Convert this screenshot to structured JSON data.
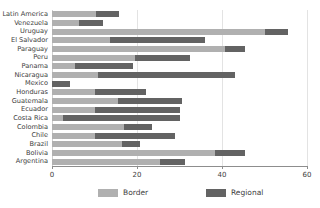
{
  "chart_data": {
    "type": "bar",
    "orientation": "horizontal",
    "stacked": true,
    "title": "",
    "xlabel": "",
    "ylabel": "",
    "xlim": [
      0,
      60
    ],
    "xticks": [
      0,
      20,
      40,
      60
    ],
    "xtick_labels": [
      "0",
      "20",
      "40",
      "60"
    ],
    "grid": true,
    "grid_axis": "x",
    "legend_position": "bottom",
    "categories": [
      "Latin America",
      "Venezuela",
      "Uruguay",
      "El Salvador",
      "Paraguay",
      "Peru",
      "Panama",
      "Nicaragua",
      "Mexico",
      "Honduras",
      "Guatemala",
      "Ecuador",
      "Costa Rica",
      "Colombia",
      "Chile",
      "Brazil",
      "Bolivia",
      "Argentina"
    ],
    "series": [
      {
        "name": "Border",
        "color": "#b0b0b0",
        "values": [
          10.4,
          6.4,
          50.1,
          13.6,
          40.7,
          19.5,
          5.4,
          10.8,
          0.0,
          10.1,
          15.5,
          10.1,
          2.6,
          16.9,
          10.1,
          16.5,
          38.4,
          25.4
        ]
      },
      {
        "name": "Regional",
        "color": "#636363",
        "values": [
          5.4,
          5.6,
          5.4,
          22.4,
          4.7,
          12.9,
          13.6,
          32.2,
          4.2,
          12.0,
          15.1,
          20.0,
          27.5,
          6.6,
          18.8,
          4.2,
          7.1,
          5.9
        ]
      }
    ],
    "totals": [
      15.8,
      12.0,
      55.5,
      36.0,
      45.4,
      32.4,
      19.0,
      43.0,
      4.2,
      22.1,
      30.6,
      30.1,
      30.1,
      23.5,
      28.9,
      20.7,
      45.5,
      31.3
    ]
  },
  "legend": {
    "items": [
      {
        "label": "Border",
        "swatch": "border-swatch"
      },
      {
        "label": "Regional",
        "swatch": "regional-swatch"
      }
    ]
  },
  "colors": {
    "border": "#b0b0b0",
    "regional": "#636363",
    "axis": "#8d8d8d",
    "grid": "#e3e3e3",
    "text": "#3d3d3d",
    "background": "#ffffff"
  }
}
